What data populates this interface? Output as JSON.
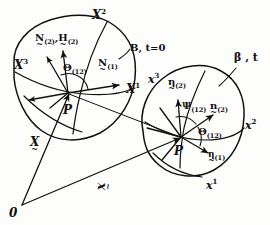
{
  "figure": {
    "origin_label": "0",
    "point_reference": "P",
    "point_current": "P",
    "config_reference": "B, t=0",
    "config_current": "β , t",
    "stroke_color": "#111111",
    "background": "#fdfdfb"
  },
  "reference_body": {
    "axes": [
      {
        "base": "X",
        "sup": "1"
      },
      {
        "base": "X",
        "sup": "2"
      },
      {
        "base": "X",
        "sup": "3"
      }
    ],
    "normal_pair": {
      "base1": "N",
      "sub1": "(2)",
      "sep": ",",
      "base2": "H",
      "sub2": "(2)"
    },
    "normal_one": {
      "base": "N",
      "sub": "(1)"
    },
    "angle": {
      "base": "Θ",
      "sub": "(12)"
    }
  },
  "current_body": {
    "axes": [
      {
        "base": "x",
        "sup": "1"
      },
      {
        "base": "x",
        "sup": "2"
      },
      {
        "base": "x",
        "sup": "3"
      }
    ],
    "eta_two_tilde": {
      "base": "η",
      "sub": "(2)"
    },
    "n_two": {
      "base": "n",
      "sub": "(2)"
    },
    "eta_one": {
      "base": "η",
      "sub": "(1)"
    },
    "psi": {
      "base": "Ψ",
      "sub": "(12)"
    },
    "theta": {
      "base": "Θ",
      "sub": "(12)"
    }
  },
  "position_vectors": {
    "reference": {
      "base": "X",
      "tilde": "~"
    },
    "current": {
      "base": "x",
      "tilde": "~"
    }
  }
}
